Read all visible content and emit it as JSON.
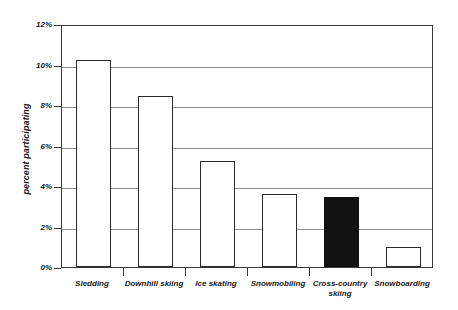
{
  "chart_data": {
    "type": "bar",
    "title": "",
    "subtitle": "",
    "xlabel": "",
    "ylabel": "percent participating",
    "categories": [
      "Sledding",
      "Downhill skiing",
      "Ice skating",
      "Snowmobiling",
      "Cross-country skiing",
      "Snowboarding"
    ],
    "category_lines": [
      [
        "Sledding"
      ],
      [
        "Downhill skiing"
      ],
      [
        "Ice skating"
      ],
      [
        "Snowmobiling"
      ],
      [
        "Cross-country",
        "skiing"
      ],
      [
        "Snowboarding"
      ]
    ],
    "values": [
      10.2,
      8.45,
      5.25,
      3.6,
      3.45,
      1.0
    ],
    "value_unit": "%",
    "bar_colors": [
      "#ffffff",
      "#ffffff",
      "#ffffff",
      "#ffffff",
      "#111111",
      "#ffffff"
    ],
    "bar_fill_names": [
      "white",
      "white",
      "white",
      "white",
      "black",
      "white"
    ],
    "bar_outline_color": "#2b2b2b",
    "ylim": [
      0,
      12
    ],
    "ytick_values": [
      0,
      2,
      4,
      6,
      8,
      10,
      12
    ],
    "ytick_labels": [
      "0%",
      "2%",
      "4%",
      "6%",
      "8%",
      "10%",
      "12%"
    ],
    "grid": true,
    "grid_axis": "y",
    "grid_color": "#8d8d8d",
    "legend": false,
    "legend_position": "none",
    "axis_color": "#3a3a3a",
    "background_color": "#ffffff",
    "highlighted_category": "Cross-country skiing",
    "annotations": []
  }
}
